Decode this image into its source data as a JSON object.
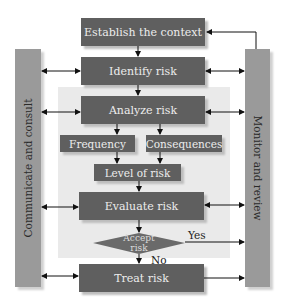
{
  "diagram": {
    "type": "risk management process flowchart",
    "boxes": {
      "establish_context": "Establish the context",
      "identify_risk": "Identify risk",
      "analyze_risk": "Analyze risk",
      "frequency": "Frequency",
      "consequences": "Consequences",
      "level_of_risk": "Level of risk",
      "evaluate_risk": "Evaluate risk",
      "treat_risk": "Treat risk"
    },
    "decision": {
      "line1": "Accept",
      "line2": "risk",
      "yes_label": "Yes",
      "no_label": "No"
    },
    "side_bars": {
      "left": "Communicate and consult",
      "right": "Monitor and review"
    },
    "colors": {
      "box_fill": "#5f5f5f",
      "box_text": "#ededed",
      "side_bar_fill": "#9a9a9a",
      "analysis_region": "#eaeaea",
      "arrow": "#111111"
    }
  }
}
